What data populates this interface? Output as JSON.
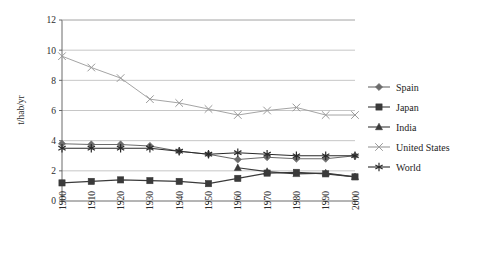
{
  "chart_data": {
    "type": "line",
    "title": "",
    "xlabel": "",
    "ylabel": "t/hab/yr",
    "x": [
      1900,
      1910,
      1920,
      1930,
      1940,
      1950,
      1960,
      1970,
      1980,
      1990,
      2000
    ],
    "categories": [
      "1900",
      "1910",
      "1920",
      "1930",
      "1940",
      "1950",
      "1960",
      "1970",
      "1980",
      "1990",
      "2000"
    ],
    "ylim": [
      0,
      12
    ],
    "yticks": [
      0,
      2,
      4,
      6,
      8,
      10,
      12
    ],
    "yticklabels": [
      "0",
      "2",
      "4",
      "6",
      "8",
      "10",
      "12"
    ],
    "grid": true,
    "legend_position": "right",
    "series": [
      {
        "name": "Spain",
        "marker": "diamond",
        "color": "#6b6b6b",
        "values": [
          3.8,
          3.75,
          3.75,
          3.65,
          3.3,
          3.1,
          2.75,
          2.9,
          2.8,
          2.8,
          3.0
        ]
      },
      {
        "name": "Japan",
        "marker": "square",
        "color": "#3a3a3a",
        "values": [
          1.2,
          1.3,
          1.4,
          1.35,
          1.3,
          1.15,
          1.5,
          1.85,
          1.9,
          1.8,
          1.6
        ]
      },
      {
        "name": "India",
        "marker": "triangle",
        "color": "#3a3a3a",
        "values": [
          null,
          null,
          null,
          null,
          null,
          null,
          2.2,
          1.95,
          1.8,
          1.85,
          1.6
        ]
      },
      {
        "name": "United States",
        "marker": "cross",
        "color": "#9a9a9a",
        "values": [
          9.6,
          8.85,
          8.15,
          6.75,
          6.5,
          6.1,
          5.7,
          6.0,
          6.2,
          5.7,
          5.7
        ]
      },
      {
        "name": "World",
        "marker": "star",
        "color": "#2a2a2a",
        "values": [
          3.5,
          3.5,
          3.5,
          3.5,
          3.3,
          3.1,
          3.2,
          3.1,
          3.0,
          3.0,
          3.0
        ]
      }
    ]
  },
  "legend": {
    "items": [
      {
        "label": "Spain"
      },
      {
        "label": "Japan"
      },
      {
        "label": "India"
      },
      {
        "label": "United States"
      },
      {
        "label": "World"
      }
    ]
  }
}
